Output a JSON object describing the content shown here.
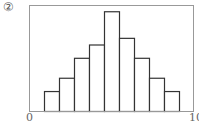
{
  "figure_label": "②",
  "chart_data": {
    "type": "bar",
    "subtype": "histogram",
    "title": "",
    "xlabel": "",
    "ylabel": "",
    "x_tick_labels": [
      "0",
      "100"
    ],
    "xlim": [
      0,
      100
    ],
    "bin_edges": [
      9,
      18,
      27,
      36,
      45,
      55,
      64,
      73,
      82,
      91
    ],
    "values": [
      3,
      5,
      8,
      10,
      15,
      11,
      8,
      5,
      3
    ],
    "y_ticks_shown": false,
    "grid": false,
    "legend": null,
    "style": {
      "bar_fill": "#ffffff",
      "bar_stroke": "#333333",
      "frame_color": "#999999"
    }
  }
}
